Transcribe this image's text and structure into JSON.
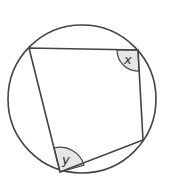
{
  "diagram": {
    "type": "cyclic-quadrilateral",
    "circle": {
      "cx": 82,
      "cy": 99,
      "r": 74
    },
    "vertices": {
      "top_left": [
        29,
        48
      ],
      "top_right": [
        138,
        50
      ],
      "right": [
        143,
        140
      ],
      "bottom": [
        60,
        172
      ]
    },
    "angles": [
      {
        "vertex": "top_right",
        "label": "x"
      },
      {
        "vertex": "bottom",
        "label": "y"
      }
    ],
    "colors": {
      "stroke": "#444444",
      "shade": "#e6e6e6"
    }
  }
}
